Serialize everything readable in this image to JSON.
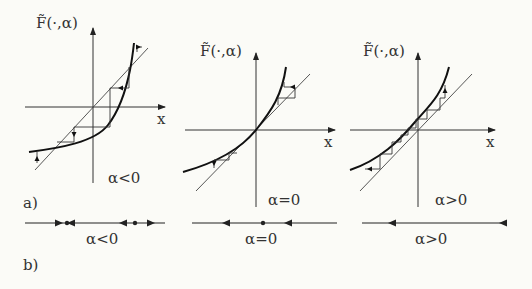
{
  "figure": {
    "part_a_label": "a)",
    "part_b_label": "b)",
    "panels": [
      {
        "y_axis_label": "F̃(·,α)",
        "x_axis_label": "x",
        "condition": "α<0",
        "description": "curve crosses diagonal at two fixed points; cobweb iterations"
      },
      {
        "y_axis_label": "F̃(·,α)",
        "x_axis_label": "x",
        "condition": "α=0",
        "description": "curve tangent to diagonal at origin"
      },
      {
        "y_axis_label": "F̃(·,α)",
        "x_axis_label": "x",
        "condition": "α>0",
        "description": "curve entirely above diagonal, no fixed points"
      }
    ],
    "phase_lines": [
      {
        "condition": "α<0",
        "fixed_points": 2
      },
      {
        "condition": "α=0",
        "fixed_points": 1
      },
      {
        "condition": "α>0",
        "fixed_points": 0
      }
    ]
  },
  "colors": {
    "ink": "#222222",
    "background": "#fbfbf7"
  }
}
